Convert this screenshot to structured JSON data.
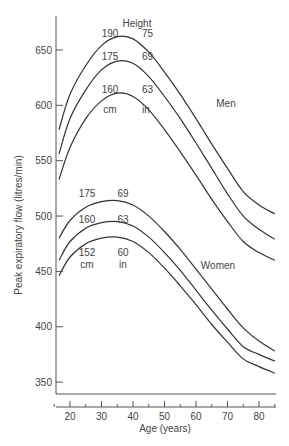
{
  "chart_data": {
    "type": "line",
    "title": "",
    "xlabel": "Age (years)",
    "ylabel": "Peak expiratory flow (litres/min)",
    "xlim": [
      15,
      85
    ],
    "ylim": [
      340,
      680
    ],
    "x_ticks": [
      20,
      30,
      40,
      50,
      60,
      70,
      80
    ],
    "y_ticks": [
      350,
      400,
      450,
      500,
      550,
      600,
      650
    ],
    "grid": false,
    "legend": "inline labels",
    "annotations": {
      "height_header": "Height",
      "men_label": "Men",
      "women_label": "Women",
      "men_heights": [
        {
          "cm": "190",
          "in": "75"
        },
        {
          "cm": "175",
          "in": "69"
        },
        {
          "cm": "160",
          "in": "63"
        }
      ],
      "women_heights": [
        {
          "cm": "175",
          "in": "69"
        },
        {
          "cm": "160",
          "in": "63"
        },
        {
          "cm": "152",
          "in": "60"
        }
      ],
      "men_units": {
        "cm": "cm",
        "in": "in"
      },
      "women_units": {
        "cm": "cm",
        "in": "in"
      }
    },
    "x": [
      15,
      20,
      25,
      30,
      35,
      40,
      45,
      50,
      55,
      60,
      65,
      70,
      75,
      80,
      85
    ],
    "series": [
      {
        "name": "Men 190 cm (75 in)",
        "values": [
          578,
          610,
          636,
          654,
          662,
          660,
          648,
          630,
          610,
          588,
          565,
          543,
          522,
          510,
          502
        ]
      },
      {
        "name": "Men 175 cm (69 in)",
        "values": [
          556,
          588,
          614,
          632,
          640,
          638,
          626,
          608,
          588,
          566,
          543,
          520,
          500,
          488,
          479
        ]
      },
      {
        "name": "Men 160 cm (63 in)",
        "values": [
          533,
          562,
          588,
          604,
          611,
          608,
          596,
          578,
          558,
          537,
          515,
          495,
          477,
          467,
          460
        ]
      },
      {
        "name": "Women 175 cm (69 in)",
        "values": [
          480,
          496,
          508,
          513,
          514,
          510,
          500,
          486,
          470,
          452,
          434,
          416,
          399,
          387,
          378
        ]
      },
      {
        "name": "Women 160 cm (63 in)",
        "values": [
          460,
          477,
          489,
          494,
          495,
          491,
          481,
          467,
          451,
          433,
          415,
          398,
          382,
          375,
          369
        ]
      },
      {
        "name": "Women 152 cm (60 in)",
        "values": [
          446,
          463,
          475,
          480,
          481,
          477,
          467,
          453,
          437,
          420,
          402,
          386,
          371,
          364,
          358
        ]
      }
    ]
  }
}
